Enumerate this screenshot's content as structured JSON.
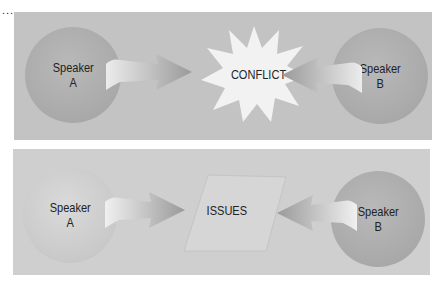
{
  "continuation_marker": "...",
  "top_panel": {
    "speaker_a": {
      "line1": "Speaker",
      "line2": "A"
    },
    "speaker_b": {
      "line1": "Speaker",
      "line2": "B"
    },
    "center_label": "CONFLICT",
    "center_shape": "starburst"
  },
  "bottom_panel": {
    "speaker_a": {
      "line1": "Speaker",
      "line2": "A"
    },
    "speaker_b": {
      "line1": "Speaker",
      "line2": "B"
    },
    "center_label": "ISSUES",
    "center_shape": "faint-parallelogram"
  },
  "colors": {
    "panel_top": "#c3c3c3",
    "panel_bottom": "#cfcfcf",
    "circle_dark": "#a9a9a9",
    "circle_light": "#c9c9c9",
    "starburst": "#f2f2f2",
    "text": "#222222"
  }
}
